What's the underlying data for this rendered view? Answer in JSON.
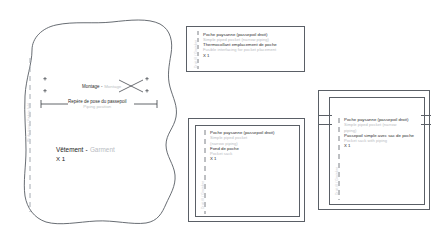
{
  "document": {
    "type": "sewing-pattern-sheet",
    "language_primary": "French",
    "language_secondary": "English",
    "background_color": "#ffffff",
    "ink_color": "#2b2b2b",
    "translation_color": "#b9bcc2",
    "outline_color": "#5a5f66"
  },
  "garment_piece": {
    "name": "garment-main-piece",
    "title_fr": "Vêtement",
    "title_dash": "-",
    "title_en": "Garment",
    "quantity": "X 1",
    "fold_label": "Pli du tissu / Fabric fold",
    "montage": {
      "fr": "Montage",
      "dash": "-",
      "en": "Montage"
    },
    "repere": {
      "fr": "Repère de pose du passepoil",
      "en": "Piping position"
    }
  },
  "boxes": [
    {
      "id": "box-thermocollant",
      "name": "pattern-piece-interfacing",
      "line1_fr": "Poche paysanne (passepoil droit)",
      "line1_en": "Simple piped pocket (narrow piping)",
      "line2_fr": "Thermocollant emplacement de poche",
      "line2_en": "Fusible interfacing for pocket placement",
      "quantity": "X 1",
      "vert_label": "Droit fil / Grainline"
    },
    {
      "id": "box-fond-de-poche",
      "name": "pattern-piece-pocket-bag",
      "line1_fr": "Poche paysanne (passepoil droit)",
      "line1_en": "Simple piped pocket",
      "line1_en2": "(narrow piping)",
      "line2_fr": "Fond de poche",
      "line2_en": "Pocket sack",
      "quantity": "X 1",
      "vert_label": "Droit fil / Grainline"
    },
    {
      "id": "box-passepoil-sac",
      "name": "pattern-piece-piping-with-bag",
      "line1_fr": "Poche paysanne (passepoil droit)",
      "line1_en": "Simple piped pocket (narrow",
      "line1_en2": "piping)",
      "line2_fr": "Passepoil simple avec sac de poche",
      "line2_en": "Pocket sack with piping",
      "quantity": "X 1",
      "vert_label": "Droit fil / Grainline"
    }
  ]
}
